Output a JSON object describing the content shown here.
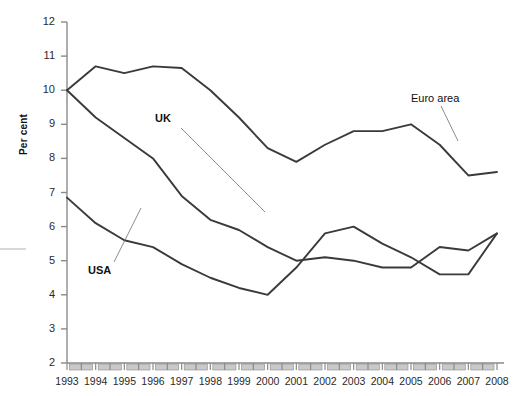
{
  "chart_data": {
    "type": "line",
    "title": "",
    "xlabel": "",
    "ylabel": "Per cent",
    "ylim": [
      2,
      12
    ],
    "ytick_labels": [
      "12",
      "11",
      "10",
      "9",
      "8",
      "7",
      "6",
      "5",
      "4",
      "3",
      "2"
    ],
    "grid": false,
    "legend_position": "inline-annotations",
    "x": [
      1993,
      1994,
      1995,
      1996,
      1997,
      1998,
      1999,
      2000,
      2001,
      2002,
      2003,
      2004,
      2005,
      2006,
      2007,
      2008
    ],
    "categories": [
      "1993",
      "1994",
      "1995",
      "1996",
      "1997",
      "1998",
      "1999",
      "2000",
      "2001",
      "2002",
      "2003",
      "2004",
      "2005",
      "2006",
      "2007",
      "2008"
    ],
    "series": [
      {
        "name": "Euro area",
        "values": [
          10.0,
          10.7,
          10.5,
          10.7,
          10.65,
          10.0,
          9.2,
          8.3,
          7.9,
          8.4,
          8.8,
          8.8,
          9.0,
          8.4,
          7.5,
          7.6
        ]
      },
      {
        "name": "UK",
        "values": [
          10.0,
          9.2,
          8.6,
          8.0,
          6.9,
          6.2,
          5.9,
          5.4,
          5.0,
          5.1,
          5.0,
          4.8,
          4.8,
          5.4,
          5.3,
          5.8
        ]
      },
      {
        "name": "USA",
        "values": [
          6.85,
          6.1,
          5.6,
          5.4,
          4.9,
          4.5,
          4.2,
          4.0,
          4.8,
          5.8,
          6.0,
          5.5,
          5.1,
          4.6,
          4.6,
          5.8
        ]
      }
    ],
    "annotations": [
      {
        "text": "UK",
        "bold": true
      },
      {
        "text": "USA",
        "bold": true
      },
      {
        "text": "Euro area",
        "bold": false
      }
    ]
  },
  "colors": {
    "line": "#3a3a3a",
    "axis": "#8a8a8a",
    "tick_fill": "#c9c9c9",
    "text": "#1a1a1a",
    "background": "#ffffff"
  }
}
